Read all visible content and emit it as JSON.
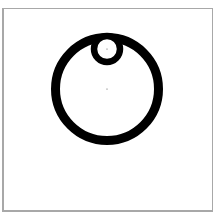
{
  "diagram": {
    "frame_color": "#a8a8a8",
    "shapes": [
      {
        "type": "circle",
        "name": "outer-ring",
        "cx": 107,
        "cy": 89,
        "r": 51.5,
        "stroke": "#000000",
        "stroke_width": 9,
        "fill": "none"
      },
      {
        "type": "circle",
        "name": "inner-ring",
        "cx": 107,
        "cy": 49,
        "r": 13,
        "stroke": "#000000",
        "stroke_width": 6.5,
        "fill": "#ffffff"
      },
      {
        "type": "point",
        "name": "outer-center",
        "cx": 107,
        "cy": 89
      },
      {
        "type": "point",
        "name": "inner-center",
        "cx": 107,
        "cy": 49
      }
    ]
  }
}
